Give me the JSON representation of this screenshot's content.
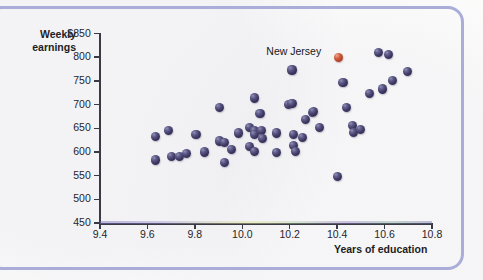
{
  "chart": {
    "y_axis_title_line1": "Weekly",
    "y_axis_title_line2": "earnings",
    "x_axis_title": "Years of education",
    "annotation_label": "New Jersey",
    "y_ticks": [
      "$850",
      "800",
      "750",
      "700",
      "650",
      "600",
      "550",
      "500",
      "450"
    ],
    "x_ticks": [
      "9.4",
      "9.6",
      "9.8",
      "10.0",
      "10.2",
      "10.4",
      "10.6",
      "10.8"
    ],
    "colors": {
      "point": "#3b3560",
      "highlight_point": "#b8412a",
      "frame": "#a9add8",
      "axis": "#3a3a44",
      "text": "#1d1d24"
    }
  },
  "chart_data": {
    "type": "scatter",
    "title": "",
    "xlabel": "Years of education",
    "ylabel": "Weekly earnings",
    "xlim": [
      9.4,
      10.8
    ],
    "ylim": [
      450,
      850
    ],
    "xticks": [
      9.4,
      9.6,
      9.8,
      10.0,
      10.2,
      10.4,
      10.6,
      10.8
    ],
    "yticks": [
      450,
      500,
      550,
      600,
      650,
      700,
      750,
      800,
      850
    ],
    "grid": false,
    "legend": "none",
    "annotations": [
      {
        "text": "New Jersey",
        "x": 10.4,
        "y": 805,
        "points_to_index": 52
      }
    ],
    "series": [
      {
        "name": "States",
        "marker": "sphere",
        "color": "#3b3560",
        "points": [
          {
            "x": 9.635,
            "y": 633
          },
          {
            "x": 9.635,
            "y": 583
          },
          {
            "x": 9.69,
            "y": 646
          },
          {
            "x": 9.7,
            "y": 591
          },
          {
            "x": 9.735,
            "y": 590
          },
          {
            "x": 9.765,
            "y": 597
          },
          {
            "x": 9.805,
            "y": 636
          },
          {
            "x": 9.84,
            "y": 600
          },
          {
            "x": 9.905,
            "y": 694
          },
          {
            "x": 9.905,
            "y": 623
          },
          {
            "x": 9.925,
            "y": 620
          },
          {
            "x": 9.925,
            "y": 577
          },
          {
            "x": 9.955,
            "y": 605
          },
          {
            "x": 9.985,
            "y": 640
          },
          {
            "x": 10.03,
            "y": 651
          },
          {
            "x": 10.03,
            "y": 612
          },
          {
            "x": 10.05,
            "y": 714
          },
          {
            "x": 10.05,
            "y": 644
          },
          {
            "x": 10.05,
            "y": 636
          },
          {
            "x": 10.05,
            "y": 601
          },
          {
            "x": 10.075,
            "y": 681
          },
          {
            "x": 10.08,
            "y": 646
          },
          {
            "x": 10.085,
            "y": 628
          },
          {
            "x": 10.145,
            "y": 640
          },
          {
            "x": 10.145,
            "y": 599
          },
          {
            "x": 10.195,
            "y": 700
          },
          {
            "x": 10.21,
            "y": 702
          },
          {
            "x": 10.21,
            "y": 773
          },
          {
            "x": 10.215,
            "y": 637
          },
          {
            "x": 10.215,
            "y": 614
          },
          {
            "x": 10.225,
            "y": 601
          },
          {
            "x": 10.255,
            "y": 630
          },
          {
            "x": 10.265,
            "y": 668
          },
          {
            "x": 10.295,
            "y": 683
          },
          {
            "x": 10.3,
            "y": 686
          },
          {
            "x": 10.325,
            "y": 651
          },
          {
            "x": 10.4,
            "y": 548
          },
          {
            "x": 10.425,
            "y": 746
          },
          {
            "x": 10.44,
            "y": 694
          },
          {
            "x": 10.465,
            "y": 656
          },
          {
            "x": 10.47,
            "y": 641
          },
          {
            "x": 10.5,
            "y": 648
          },
          {
            "x": 10.535,
            "y": 723
          },
          {
            "x": 10.575,
            "y": 810
          },
          {
            "x": 10.59,
            "y": 733
          },
          {
            "x": 10.615,
            "y": 806
          },
          {
            "x": 10.635,
            "y": 751
          },
          {
            "x": 10.695,
            "y": 770
          }
        ]
      },
      {
        "name": "New Jersey",
        "marker": "sphere",
        "color": "#b8412a",
        "points": [
          {
            "x": 10.405,
            "y": 800
          }
        ]
      }
    ]
  }
}
